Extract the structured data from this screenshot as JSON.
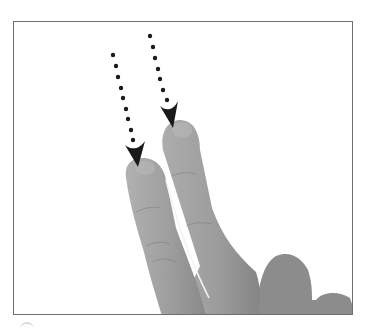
{
  "figure": {
    "gesture": {
      "type": "swipe",
      "direction": "down",
      "finger_count": 2
    },
    "arrows": [
      {
        "id": "left-arrow",
        "style": "dotted",
        "from": [
          113,
          55
        ],
        "to": [
          138,
          165
        ]
      },
      {
        "id": "right-arrow",
        "style": "dotted",
        "from": [
          150,
          36
        ],
        "to": [
          173,
          127
        ]
      }
    ],
    "colors": {
      "frame_border": "#6e6e6e",
      "arrow": "#1a1a1a",
      "skin": "#9a9a9a",
      "background": "#ffffff"
    }
  }
}
